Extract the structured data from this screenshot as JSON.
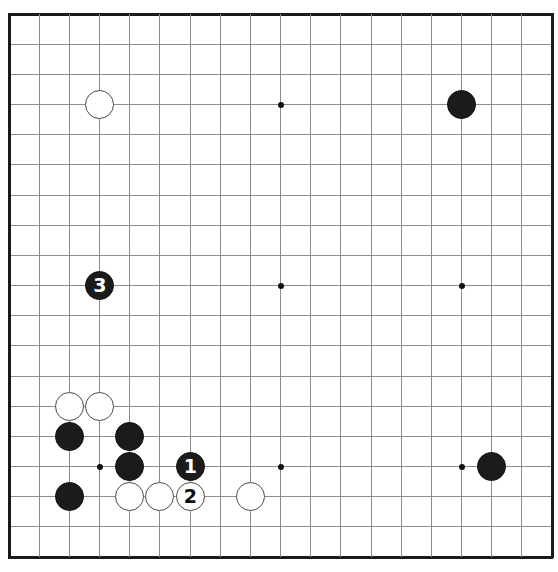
{
  "diagram": {
    "kind": "go-board-diagram",
    "board_size": 19,
    "geometry": {
      "origin_x": 9,
      "origin_y": 14,
      "spacing": 30.17,
      "stone_diameter": 29,
      "edge_thickness": 3,
      "line_thickness": 1
    },
    "colors": {
      "background": "#ffffff",
      "grid_line": "#8c8c8c",
      "border_line": "#1a1a1a",
      "black_stone": "#1b1b1b",
      "white_stone": "#ffffff",
      "white_stone_outline": "#4a4a4a",
      "star_point": "#111111",
      "black_label_text": "#ffffff",
      "white_label_text": "#111111"
    },
    "star_points": [
      {
        "col": 3,
        "row": 3
      },
      {
        "col": 9,
        "row": 3
      },
      {
        "col": 15,
        "row": 3
      },
      {
        "col": 3,
        "row": 9
      },
      {
        "col": 9,
        "row": 9
      },
      {
        "col": 15,
        "row": 9
      },
      {
        "col": 3,
        "row": 15
      },
      {
        "col": 9,
        "row": 15
      },
      {
        "col": 15,
        "row": 15
      }
    ],
    "stones": [
      {
        "col": 3,
        "row": 3,
        "color": "white",
        "label": ""
      },
      {
        "col": 15,
        "row": 3,
        "color": "black",
        "label": ""
      },
      {
        "col": 3,
        "row": 9,
        "color": "black",
        "label": "3"
      },
      {
        "col": 2,
        "row": 13,
        "color": "white",
        "label": ""
      },
      {
        "col": 3,
        "row": 13,
        "color": "white",
        "label": ""
      },
      {
        "col": 2,
        "row": 14,
        "color": "black",
        "label": ""
      },
      {
        "col": 4,
        "row": 14,
        "color": "black",
        "label": ""
      },
      {
        "col": 4,
        "row": 15,
        "color": "black",
        "label": ""
      },
      {
        "col": 6,
        "row": 15,
        "color": "black",
        "label": "1"
      },
      {
        "col": 16,
        "row": 15,
        "color": "black",
        "label": ""
      },
      {
        "col": 2,
        "row": 16,
        "color": "black",
        "label": ""
      },
      {
        "col": 4,
        "row": 16,
        "color": "white",
        "label": ""
      },
      {
        "col": 5,
        "row": 16,
        "color": "white",
        "label": ""
      },
      {
        "col": 6,
        "row": 16,
        "color": "white",
        "label": "2"
      },
      {
        "col": 8,
        "row": 16,
        "color": "white",
        "label": ""
      }
    ],
    "move_sequence": [
      {
        "number": "1",
        "color": "black",
        "col": 6,
        "row": 15
      },
      {
        "number": "2",
        "color": "white",
        "col": 6,
        "row": 16
      },
      {
        "number": "3",
        "color": "black",
        "col": 3,
        "row": 9
      }
    ]
  }
}
